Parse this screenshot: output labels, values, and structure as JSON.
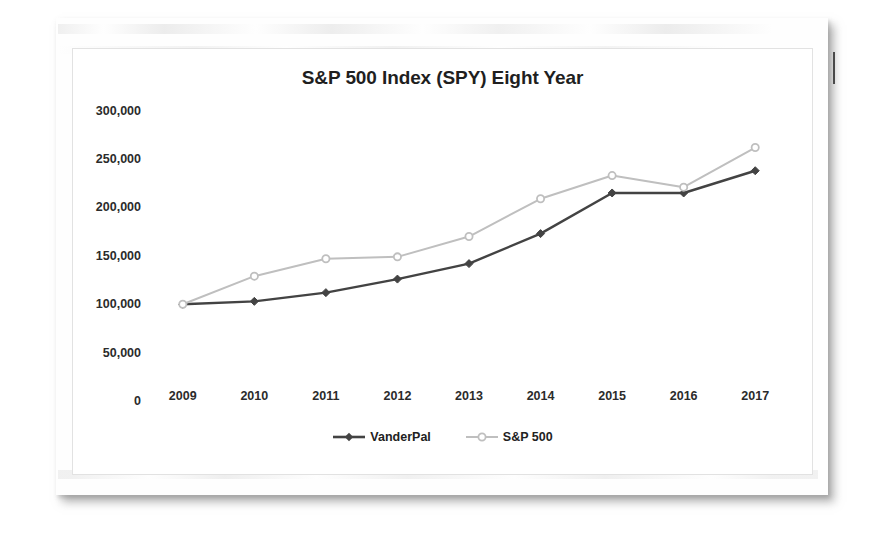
{
  "document": {
    "page_kind": "scanned-page",
    "pen_mark": "vertical-tick"
  },
  "chart_data": {
    "type": "line",
    "title": "S&P 500 Index (SPY) Eight Year",
    "xlabel": "",
    "ylabel": "",
    "categories": [
      "2009",
      "2010",
      "2011",
      "2012",
      "2013",
      "2014",
      "2015",
      "2016",
      "2017"
    ],
    "ylim": [
      0,
      300000
    ],
    "yticks": [
      0,
      50000,
      100000,
      150000,
      200000,
      250000,
      300000
    ],
    "ytick_labels": [
      "0",
      "50,000",
      "100,000",
      "150,000",
      "200,000",
      "250,000",
      "300,000"
    ],
    "grid": false,
    "legend_position": "bottom",
    "series": [
      {
        "name": "VanderPal",
        "color": "#434343",
        "marker": "filled-diamond",
        "values": [
          100000,
          103000,
          112000,
          126000,
          142000,
          173000,
          215000,
          215000,
          238000
        ]
      },
      {
        "name": "S&P 500",
        "color": "#bfbfbf",
        "marker": "open-circle",
        "values": [
          100000,
          129000,
          147000,
          149000,
          170000,
          209000,
          233000,
          221000,
          262000
        ]
      }
    ]
  }
}
